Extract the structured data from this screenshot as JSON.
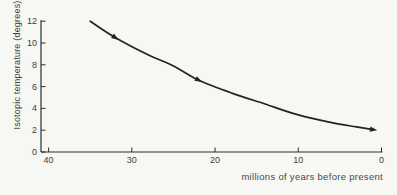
{
  "figure": {
    "background_color": "#f7f7f4",
    "axis_color": "#2e2e2c",
    "curve_color": "#24241f",
    "text_color": "#3d3d3d"
  },
  "chart_data": {
    "type": "line",
    "title": "",
    "xlabel": "millions of years before present",
    "ylabel": "Isotopic temperature (degrees)",
    "xlim": [
      40,
      0
    ],
    "ylim": [
      0,
      12
    ],
    "x_ticks": [
      40,
      30,
      20,
      10,
      0
    ],
    "y_ticks": [
      0,
      2,
      4,
      6,
      8,
      10,
      12
    ],
    "x_axis_reversed": true,
    "grid": false,
    "legend": null,
    "series": [
      {
        "name": "isotopic-temperature-curve",
        "x": [
          35,
          32,
          28,
          25,
          22,
          18,
          14,
          10,
          6,
          3,
          1
        ],
        "y": [
          12,
          10.5,
          8.9,
          7.9,
          6.6,
          5.4,
          4.4,
          3.4,
          2.7,
          2.3,
          2.05
        ]
      }
    ],
    "arrow_markers": [
      {
        "x": 32,
        "y": 10.5
      },
      {
        "x": 22,
        "y": 6.6
      },
      {
        "x": 1,
        "y": 2.05
      }
    ]
  }
}
